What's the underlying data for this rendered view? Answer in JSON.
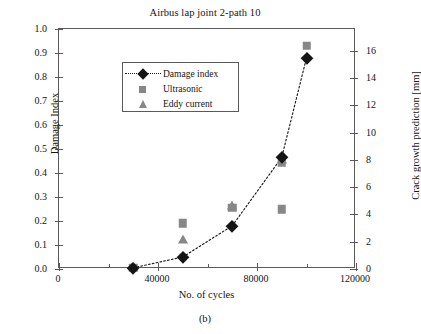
{
  "figure": {
    "caption": "(b)"
  },
  "chart_data": {
    "type": "scatter",
    "title": "Airbus lap joint 2-path 10",
    "xlabel": "No. of cycles",
    "ylabel": "Damage Index",
    "y2label": "Crack growth prediction [mm]",
    "xlim": [
      0,
      120000
    ],
    "ylim": [
      0.0,
      1.0
    ],
    "y2lim": [
      0,
      17.6
    ],
    "grid": false,
    "legend_position": "top-left",
    "xticks": [
      0,
      40000,
      80000,
      120000
    ],
    "xtick_labels": [
      "0",
      "40000",
      "80000",
      "120000"
    ],
    "xticks_minor": [
      20000,
      60000,
      100000
    ],
    "yticks": [
      0.0,
      0.1,
      0.2,
      0.3,
      0.4,
      0.5,
      0.6,
      0.7,
      0.8,
      0.9,
      1.0
    ],
    "ytick_labels": [
      "0.0",
      "0.1",
      "0.2",
      "0.3",
      "0.4",
      "0.5",
      "0.6",
      "0.7",
      "0.8",
      "0.9",
      "1.0"
    ],
    "y2ticks": [
      0,
      2,
      4,
      6,
      8,
      10,
      12,
      14,
      16
    ],
    "y2tick_labels": [
      "0",
      "2",
      "4",
      "6",
      "8",
      "10",
      "12",
      "14",
      "16"
    ],
    "series": [
      {
        "name": "Damage index",
        "marker": "diamond",
        "color": "#151515",
        "linestyle": "dotted",
        "axis": "left",
        "points": [
          {
            "x": 30000,
            "y": 0.005
          },
          {
            "x": 50000,
            "y": 0.05
          },
          {
            "x": 70000,
            "y": 0.18
          },
          {
            "x": 90000,
            "y": 0.465
          },
          {
            "x": 100000,
            "y": 0.88
          }
        ]
      },
      {
        "name": "Ultrasonic",
        "marker": "square",
        "color": "#878787",
        "linestyle": "none",
        "axis": "right",
        "points": [
          {
            "x": 30000,
            "y": 0.005
          },
          {
            "x": 50000,
            "y": 0.19
          },
          {
            "x": 70000,
            "y": 0.255
          },
          {
            "x": 90000,
            "y": 0.445
          },
          {
            "x": 90000,
            "y": 0.248
          },
          {
            "x": 100000,
            "y": 0.93
          }
        ]
      },
      {
        "name": "Eddy current",
        "marker": "triangle",
        "color": "#878787",
        "linestyle": "none",
        "axis": "right",
        "points": [
          {
            "x": 50000,
            "y": 0.125
          },
          {
            "x": 70000,
            "y": 0.268
          },
          {
            "x": 90000,
            "y": 0.46
          }
        ]
      }
    ]
  }
}
